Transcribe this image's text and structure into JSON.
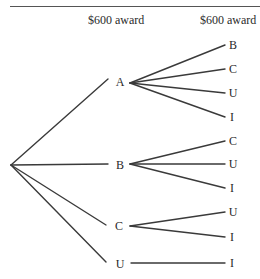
{
  "header": {
    "col1": "$600 award",
    "col2": "$600 award"
  },
  "tree": {
    "root": {
      "x": 11,
      "y": 165
    },
    "first_level": [
      {
        "label": "A",
        "x": 120,
        "y": 82,
        "line_end": {
          "x": 108,
          "y": 79
        },
        "branch_from": {
          "x": 130,
          "y": 83
        },
        "children": [
          {
            "label": "B",
            "y": 45
          },
          {
            "label": "C",
            "y": 69
          },
          {
            "label": "U",
            "y": 93
          },
          {
            "label": "I",
            "y": 117
          }
        ]
      },
      {
        "label": "B",
        "x": 120,
        "y": 165,
        "line_end": {
          "x": 108,
          "y": 164
        },
        "branch_from": {
          "x": 130,
          "y": 164
        },
        "children": [
          {
            "label": "C",
            "y": 141
          },
          {
            "label": "U",
            "y": 164
          },
          {
            "label": "I",
            "y": 188
          }
        ]
      },
      {
        "label": "C",
        "x": 119,
        "y": 226,
        "line_end": {
          "x": 106,
          "y": 225
        },
        "branch_from": {
          "x": 130,
          "y": 226
        },
        "children": [
          {
            "label": "U",
            "y": 212
          },
          {
            "label": "I",
            "y": 237
          }
        ]
      },
      {
        "label": "U",
        "x": 120,
        "y": 264,
        "line_end": {
          "x": 106,
          "y": 262
        },
        "branch_from": {
          "x": 131,
          "y": 263
        },
        "children": [
          {
            "label": "I",
            "y": 263
          }
        ]
      }
    ],
    "leaf_line_end_x": 225,
    "leaf_label_x": 233,
    "line_color": "#3a3a3a"
  },
  "labels": {
    "n1": "A",
    "n2": "B",
    "n3": "C",
    "n4": "U",
    "a1": "B",
    "a2": "C",
    "a3": "U",
    "a4": "I",
    "b1": "C",
    "b2": "U",
    "b3": "I",
    "c1": "U",
    "c2": "I",
    "u1": "I"
  }
}
